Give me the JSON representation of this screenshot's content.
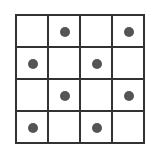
{
  "grid": {
    "rows": 4,
    "cols": 4,
    "dot_color": "#555555",
    "line_color": "#333333",
    "cells": [
      [
        false,
        true,
        false,
        true
      ],
      [
        true,
        false,
        true,
        false
      ],
      [
        false,
        true,
        false,
        true
      ],
      [
        true,
        false,
        true,
        false
      ]
    ]
  }
}
